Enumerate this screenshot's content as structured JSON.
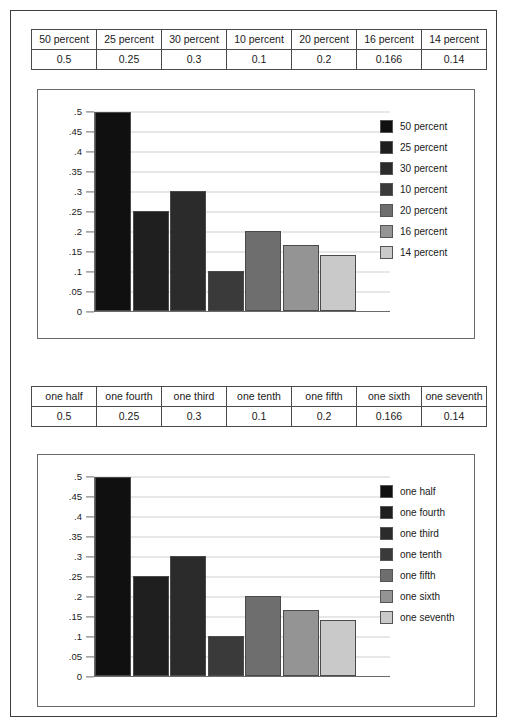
{
  "palette": {
    "series_colors": [
      "#101010",
      "#1f1f1f",
      "#2b2b2b",
      "#3a3a3a",
      "#6e6e6e",
      "#949494",
      "#c9c9c9"
    ],
    "grid_color": "#cfcfcf",
    "axis_color": "#6a6a6a",
    "frame_color": "#3d3d3d",
    "text_color": "#1a1a1a"
  },
  "tables": {
    "percent": {
      "headers": [
        "50 percent",
        "25 percent",
        "30 percent",
        "10 percent",
        "20 percent",
        "16 percent",
        "14 percent"
      ],
      "values": [
        "0.5",
        "0.25",
        "0.3",
        "0.1",
        "0.2",
        "0.166",
        "0.14"
      ]
    },
    "words": {
      "headers": [
        "one half",
        "one fourth",
        "one third",
        "one tenth",
        "one fifth",
        "one sixth",
        "one seventh"
      ],
      "values": [
        "0.5",
        "0.25",
        "0.3",
        "0.1",
        "0.2",
        "0.166",
        "0.14"
      ]
    }
  },
  "chart_data": [
    {
      "type": "bar",
      "title": "",
      "xlabel": "",
      "ylabel": "",
      "categories": [
        "50 percent",
        "25 percent",
        "30 percent",
        "10 percent",
        "20 percent",
        "16 percent",
        "14 percent"
      ],
      "values": [
        0.5,
        0.25,
        0.3,
        0.1,
        0.2,
        0.166,
        0.14
      ],
      "ylim": [
        0,
        0.5
      ],
      "ytick_values": [
        0,
        0.05,
        0.1,
        0.15,
        0.2,
        0.25,
        0.3,
        0.35,
        0.4,
        0.45,
        0.5
      ],
      "ytick_labels": [
        "0",
        ".05",
        ".1",
        ".15",
        ".2",
        ".25",
        ".3",
        ".35",
        ".4",
        ".45",
        ".5"
      ],
      "grid": true,
      "legend_position": "right",
      "legend": [
        "50 percent",
        "25 percent",
        "30 percent",
        "10 percent",
        "20 percent",
        "16 percent",
        "14 percent"
      ],
      "bar_colors": [
        "#101010",
        "#1f1f1f",
        "#2b2b2b",
        "#3a3a3a",
        "#6e6e6e",
        "#949494",
        "#c9c9c9"
      ]
    },
    {
      "type": "bar",
      "title": "",
      "xlabel": "",
      "ylabel": "",
      "categories": [
        "one half",
        "one fourth",
        "one third",
        "one tenth",
        "one fifth",
        "one sixth",
        "one seventh"
      ],
      "values": [
        0.5,
        0.25,
        0.3,
        0.1,
        0.2,
        0.166,
        0.14
      ],
      "ylim": [
        0,
        0.5
      ],
      "ytick_values": [
        0,
        0.05,
        0.1,
        0.15,
        0.2,
        0.25,
        0.3,
        0.35,
        0.4,
        0.45,
        0.5
      ],
      "ytick_labels": [
        "0",
        ".05",
        ".1",
        ".15",
        ".2",
        ".25",
        ".3",
        ".35",
        ".4",
        ".45",
        ".5"
      ],
      "grid": true,
      "legend_position": "right",
      "legend": [
        "one half",
        "one fourth",
        "one third",
        "one tenth",
        "one fifth",
        "one sixth",
        "one seventh"
      ],
      "bar_colors": [
        "#101010",
        "#1f1f1f",
        "#2b2b2b",
        "#3a3a3a",
        "#6e6e6e",
        "#949494",
        "#c9c9c9"
      ]
    }
  ]
}
